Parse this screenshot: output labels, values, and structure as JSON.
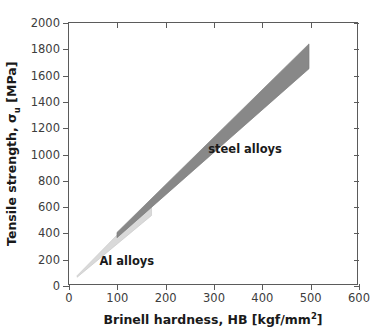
{
  "chart_data": {
    "type": "area",
    "title": "",
    "xlabel": "Brinell hardness, HB [kgf/mm²]",
    "ylabel_parts": {
      "prefix": "Tensile strength, σ",
      "subscript": "u",
      "suffix": " [MPa]"
    },
    "xlabel_parts": {
      "prefix": "Brinell hardness, HB [kgf/mm",
      "superscript": "2",
      "suffix": "]"
    },
    "xlim": [
      0,
      600
    ],
    "ylim": [
      0,
      2000
    ],
    "xticks": [
      0,
      100,
      200,
      300,
      400,
      500,
      600
    ],
    "yticks": [
      0,
      200,
      400,
      600,
      800,
      1000,
      1200,
      1400,
      1600,
      1800,
      2000
    ],
    "grid": false,
    "legend": "none",
    "ticks_both_sides": true,
    "series": [
      {
        "name": "Al alloys",
        "kind": "band",
        "color": "#d9d9d9",
        "edge_color": "#c9c9c9",
        "x_range": [
          17,
          172
        ],
        "lower_slope_mpa_per_hb": 3.05,
        "upper_slope_mpa_per_hb": 3.75,
        "lower_points": [
          [
            17,
            52
          ],
          [
            172,
            525
          ]
        ],
        "upper_points": [
          [
            17,
            64
          ],
          [
            172,
            645
          ]
        ],
        "label": "Al alloys",
        "label_position": [
          63,
          188
        ]
      },
      {
        "name": "steel alloys",
        "kind": "band",
        "color": "#888888",
        "edge_color": "#7d7d7d",
        "x_range": [
          100,
          500
        ],
        "lower_slope_mpa_per_hb": 3.3,
        "upper_slope_mpa_per_hb": 3.68,
        "lower_points": [
          [
            100,
            355
          ],
          [
            500,
            1650
          ]
        ],
        "upper_points": [
          [
            100,
            395
          ],
          [
            500,
            1840
          ]
        ],
        "label": "steel alloys",
        "label_position": [
          288,
          1040
        ]
      }
    ],
    "annotations": [
      {
        "text": "steel alloys",
        "x": 288,
        "y": 1040
      },
      {
        "text": "Al alloys",
        "x": 63,
        "y": 188
      }
    ],
    "colors": {
      "al_band": "#d9d9d9",
      "steel_band": "#888888",
      "axis": "#5b5b5b",
      "text": "#1a1a1a",
      "tick_text": "#3d3d3d",
      "background": "#ffffff"
    }
  }
}
